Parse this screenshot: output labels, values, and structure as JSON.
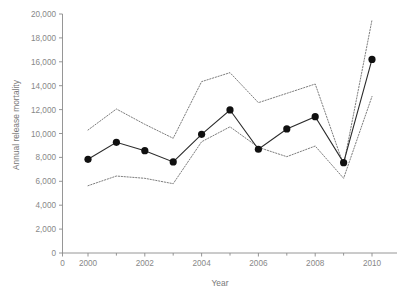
{
  "chart_data": {
    "type": "line",
    "title": "",
    "xlabel": "Year",
    "ylabel": "Annual release mortality",
    "x": [
      2000,
      2001,
      2002,
      2003,
      2004,
      2005,
      2006,
      2007,
      2008,
      2009,
      2010
    ],
    "xlim": [
      1999.15,
      2010.9
    ],
    "ylim": [
      0,
      20000
    ],
    "grid": false,
    "legend": null,
    "x_ticks_major": [
      2000,
      2002,
      2004,
      2006,
      2008,
      2010
    ],
    "x_tick_labels": [
      "0",
      "2000",
      "2002",
      "2004",
      "2006",
      "2008",
      "2010"
    ],
    "x_ticks_minor": [
      2001,
      2003,
      2005,
      2007,
      2009
    ],
    "y_ticks": [
      0,
      2000,
      4000,
      6000,
      8000,
      10000,
      12000,
      14000,
      16000,
      18000,
      20000
    ],
    "y_tick_labels": [
      "0",
      "2,000",
      "4,000",
      "6,000",
      "8,000",
      "10,000",
      "12,000",
      "14,000",
      "16,000",
      "18,000",
      "20,000"
    ],
    "series": [
      {
        "name": "Annual release mortality (estimate)",
        "style": "solid-with-markers",
        "color": "#101010",
        "values": [
          7840,
          9260,
          8560,
          7620,
          9930,
          11970,
          8680,
          10380,
          11410,
          7560,
          16200
        ]
      },
      {
        "name": "Upper confidence limit",
        "style": "dotted",
        "color": "#666666",
        "values": [
          10290,
          12050,
          10770,
          9600,
          14340,
          15090,
          12580,
          13360,
          14140,
          7360,
          19500
        ]
      },
      {
        "name": "Lower confidence limit",
        "style": "dotted",
        "color": "#666666",
        "values": [
          5630,
          6440,
          6250,
          5800,
          9310,
          10560,
          8840,
          8060,
          8950,
          6250,
          13100
        ]
      }
    ]
  }
}
